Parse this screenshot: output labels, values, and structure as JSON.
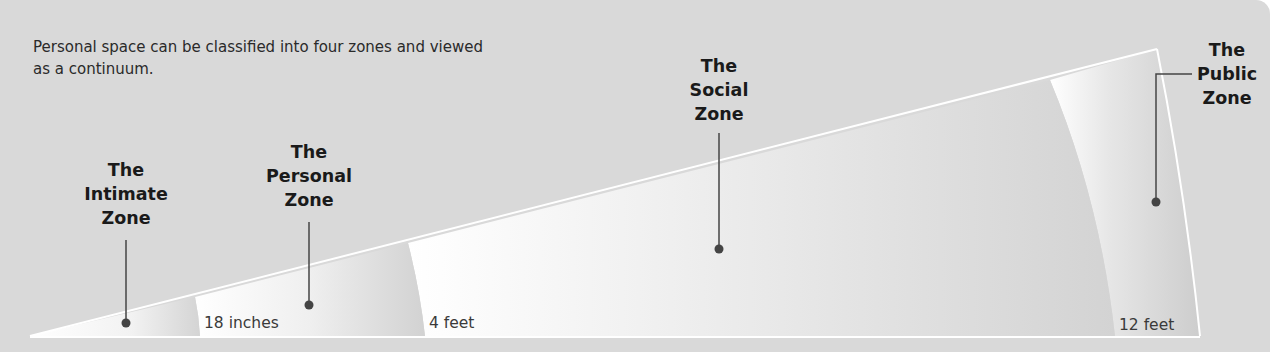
{
  "caption": "Personal space can be classified into four zones and viewed as a continuum.",
  "zones": [
    {
      "name": "The Intimate Zone",
      "lines": [
        "The",
        "Intimate",
        "Zone"
      ],
      "boundary_label": "18 inches"
    },
    {
      "name": "The Personal Zone",
      "lines": [
        "The",
        "Personal",
        "Zone"
      ],
      "boundary_label": "4 feet"
    },
    {
      "name": "The Social Zone",
      "lines": [
        "The",
        "Social",
        "Zone"
      ],
      "boundary_label": ""
    },
    {
      "name": "The Public Zone",
      "lines": [
        "The",
        "Public",
        "Zone"
      ],
      "boundary_label": "12 feet"
    }
  ],
  "colors": {
    "background": "#d9d9d9",
    "wedge_light": "#ffffff",
    "wedge_shade": "#cfcfcf",
    "leader_line": "#444444",
    "text": "#1a1a1a"
  }
}
